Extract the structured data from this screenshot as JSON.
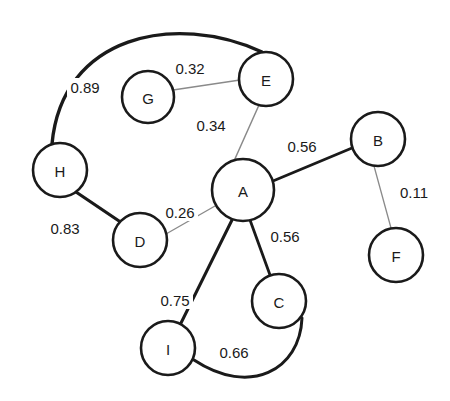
{
  "chart_data": {
    "type": "diagram",
    "diagram_kind": "weighted-undirected-graph",
    "title": "",
    "canvas": {
      "width": 450,
      "height": 401,
      "background": "#ffffff"
    },
    "style": {
      "node_fill": "#ffffff",
      "node_stroke": "#1a1a1a",
      "node_stroke_width": 2.6,
      "node_radius": 27,
      "label_color": "#1a1a1a",
      "strong_edge_color": "#1a1a1a",
      "weak_edge_color": "#8a8a8a"
    },
    "nodes": [
      {
        "id": "A",
        "label": "A",
        "x": 243,
        "y": 190,
        "r": 31
      },
      {
        "id": "B",
        "label": "B",
        "x": 378,
        "y": 139,
        "r": 27
      },
      {
        "id": "C",
        "label": "C",
        "x": 279,
        "y": 301,
        "r": 27
      },
      {
        "id": "D",
        "label": "D",
        "x": 140,
        "y": 240,
        "r": 27
      },
      {
        "id": "E",
        "label": "E",
        "x": 266,
        "y": 79,
        "r": 27
      },
      {
        "id": "F",
        "label": "F",
        "x": 396,
        "y": 255,
        "r": 27
      },
      {
        "id": "G",
        "label": "G",
        "x": 148,
        "y": 97,
        "r": 26
      },
      {
        "id": "H",
        "label": "H",
        "x": 60,
        "y": 170,
        "r": 27
      },
      {
        "id": "I",
        "label": "I",
        "x": 168,
        "y": 348,
        "r": 27
      }
    ],
    "edges": [
      {
        "id": "H-E",
        "source": "H",
        "target": "E",
        "weight": 0.89,
        "label": "0.89",
        "label_x": 85,
        "label_y": 87,
        "width": 3.4,
        "color": "#1a1a1a",
        "curve": "arc",
        "path": "M 52 144 C 62 35 175 12 262 52",
        "label_anchor": "middle"
      },
      {
        "id": "H-D",
        "source": "H",
        "target": "D",
        "weight": 0.83,
        "label": "0.83",
        "label_x": 65,
        "label_y": 228,
        "width": 3.2,
        "color": "#1a1a1a",
        "curve": "line",
        "path": "M 76 192 L 122 223"
      },
      {
        "id": "A-I",
        "source": "A",
        "target": "I",
        "weight": 0.75,
        "label": "0.75",
        "label_x": 175,
        "label_y": 300,
        "width": 3.0,
        "color": "#1a1a1a",
        "curve": "line",
        "path": "M 232 220 L 181 323"
      },
      {
        "id": "I-C",
        "source": "I",
        "target": "C",
        "weight": 0.66,
        "label": "0.66",
        "label_x": 234,
        "label_y": 352,
        "width": 3.0,
        "color": "#1a1a1a",
        "curve": "arc",
        "path": "M 194 360 C 250 397 300 370 302 318"
      },
      {
        "id": "A-B",
        "source": "A",
        "target": "B",
        "weight": 0.56,
        "label": "0.56",
        "label_x": 302,
        "label_y": 146,
        "width": 2.8,
        "color": "#1a1a1a",
        "curve": "line",
        "path": "M 273 181 L 352 148"
      },
      {
        "id": "A-C",
        "source": "A",
        "target": "C",
        "weight": 0.56,
        "label": "0.56",
        "label_x": 285,
        "label_y": 236,
        "width": 2.8,
        "color": "#1a1a1a",
        "curve": "line",
        "path": "M 250 220 L 270 275"
      },
      {
        "id": "E-A",
        "source": "E",
        "target": "A",
        "weight": 0.34,
        "label": "0.34",
        "label_x": 211,
        "label_y": 125,
        "width": 1.5,
        "color": "#8a8a8a",
        "curve": "line",
        "path": "M 259 105 L 234 161"
      },
      {
        "id": "G-E",
        "source": "G",
        "target": "E",
        "weight": 0.32,
        "label": "0.32",
        "label_x": 190,
        "label_y": 68,
        "width": 1.5,
        "color": "#8a8a8a",
        "curve": "line",
        "path": "M 173 90 L 240 80"
      },
      {
        "id": "D-A",
        "source": "D",
        "target": "A",
        "weight": 0.26,
        "label": "0.26",
        "label_x": 180,
        "label_y": 212,
        "width": 1.4,
        "color": "#8a8a8a",
        "curve": "line",
        "path": "M 166 234 L 215 206"
      },
      {
        "id": "B-F",
        "source": "B",
        "target": "F",
        "weight": 0.11,
        "label": "0.11",
        "label_x": 414,
        "label_y": 192,
        "width": 1.3,
        "color": "#8a8a8a",
        "curve": "line",
        "path": "M 374 166 L 391 228"
      }
    ],
    "legend": {
      "present": false
    },
    "axes": {
      "present": false
    },
    "grid": false,
    "node_count": 9,
    "edge_count": 10,
    "weight_range": [
      0.11,
      0.89
    ]
  }
}
